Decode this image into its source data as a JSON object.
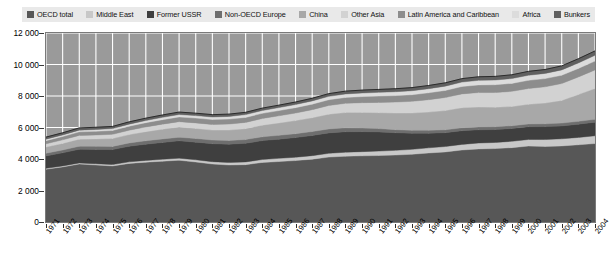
{
  "chart_data": {
    "type": "area",
    "title": "",
    "xlabel": "",
    "ylabel": "",
    "ylim": [
      0,
      12000
    ],
    "yticks": [
      "0",
      "2 000",
      "4 000",
      "6 000",
      "8 000",
      "10 000",
      "12 000"
    ],
    "ytick_values": [
      0,
      2000,
      4000,
      6000,
      8000,
      10000,
      12000
    ],
    "grid": true,
    "legend_position": "top",
    "stacked": true,
    "categories": [
      "1971",
      "1972",
      "1973",
      "1974",
      "1975",
      "1976",
      "1977",
      "1978",
      "1979",
      "1980",
      "1981",
      "1982",
      "1983",
      "1984",
      "1985",
      "1986",
      "1987",
      "1988",
      "1989",
      "1990",
      "1991",
      "1992",
      "1993",
      "1994",
      "1995",
      "1996",
      "1997",
      "1998",
      "1999",
      "2000",
      "2001",
      "2002",
      "2003",
      "2004"
    ],
    "series": [
      {
        "name": "OECD total",
        "color": "#575757",
        "values": [
          3350,
          3500,
          3680,
          3620,
          3560,
          3720,
          3800,
          3860,
          3920,
          3810,
          3680,
          3620,
          3640,
          3780,
          3840,
          3900,
          3990,
          4120,
          4180,
          4200,
          4220,
          4250,
          4300,
          4380,
          4450,
          4570,
          4640,
          4660,
          4720,
          4820,
          4800,
          4830,
          4900,
          4980
        ]
      },
      {
        "name": "Middle East",
        "color": "#c8c8c8",
        "values": [
          55,
          62,
          70,
          78,
          88,
          98,
          110,
          120,
          132,
          140,
          150,
          162,
          176,
          188,
          200,
          212,
          224,
          238,
          252,
          268,
          282,
          298,
          312,
          328,
          342,
          358,
          374,
          390,
          404,
          420,
          436,
          452,
          470,
          492
        ]
      },
      {
        "name": "Former USSR",
        "color": "#3f3f3f",
        "values": [
          790,
          830,
          870,
          910,
          950,
          990,
          1030,
          1070,
          1100,
          1120,
          1140,
          1160,
          1180,
          1200,
          1220,
          1250,
          1280,
          1300,
          1300,
          1270,
          1220,
          1120,
          1020,
          930,
          880,
          870,
          840,
          820,
          810,
          810,
          820,
          820,
          840,
          860
        ]
      },
      {
        "name": "Non-OECD Europe",
        "color": "#6e6e6e",
        "values": [
          170,
          180,
          190,
          196,
          202,
          210,
          218,
          224,
          230,
          232,
          234,
          236,
          238,
          240,
          242,
          246,
          248,
          250,
          246,
          228,
          208,
          196,
          188,
          182,
          182,
          186,
          184,
          180,
          176,
          176,
          178,
          178,
          180,
          184
        ]
      },
      {
        "name": "China",
        "color": "#a8a8a8",
        "values": [
          390,
          420,
          450,
          470,
          500,
          530,
          580,
          620,
          650,
          640,
          630,
          660,
          690,
          740,
          790,
          830,
          880,
          940,
          970,
          990,
          1010,
          1050,
          1100,
          1160,
          1220,
          1270,
          1260,
          1240,
          1220,
          1250,
          1320,
          1440,
          1700,
          1960
        ]
      },
      {
        "name": "Other Asia",
        "color": "#d2d2d2",
        "values": [
          210,
          225,
          240,
          250,
          265,
          280,
          300,
          320,
          340,
          350,
          360,
          380,
          400,
          425,
          450,
          480,
          510,
          550,
          585,
          620,
          655,
          700,
          740,
          785,
          830,
          880,
          920,
          930,
          965,
          1000,
          1030,
          1070,
          1120,
          1180
        ]
      },
      {
        "name": "Latin America and Caribbean",
        "color": "#8d8d8d",
        "values": [
          200,
          210,
          225,
          235,
          245,
          258,
          270,
          285,
          300,
          305,
          310,
          315,
          318,
          325,
          332,
          342,
          352,
          365,
          375,
          385,
          398,
          410,
          422,
          438,
          450,
          468,
          485,
          495,
          505,
          520,
          520,
          528,
          540,
          560
        ]
      },
      {
        "name": "Africa",
        "color": "#dcdcdc",
        "values": [
          95,
          100,
          108,
          114,
          120,
          128,
          136,
          144,
          152,
          158,
          164,
          170,
          176,
          182,
          190,
          198,
          206,
          214,
          222,
          230,
          238,
          246,
          254,
          262,
          272,
          282,
          292,
          300,
          310,
          320,
          330,
          340,
          352,
          366
        ]
      },
      {
        "name": "Bunkers",
        "color": "#606060",
        "values": [
          130,
          136,
          142,
          140,
          138,
          144,
          148,
          152,
          156,
          152,
          148,
          146,
          146,
          150,
          154,
          160,
          166,
          172,
          178,
          184,
          186,
          192,
          196,
          202,
          210,
          218,
          226,
          230,
          238,
          248,
          248,
          254,
          264,
          278
        ]
      }
    ]
  },
  "legend": {
    "items": [
      {
        "label": "OECD total",
        "color": "#575757"
      },
      {
        "label": "Middle East",
        "color": "#c8c8c8"
      },
      {
        "label": "Former USSR",
        "color": "#3f3f3f"
      },
      {
        "label": "Non-OECD Europe",
        "color": "#6e6e6e"
      },
      {
        "label": "China",
        "color": "#a8a8a8"
      },
      {
        "label": "Other Asia",
        "color": "#d2d2d2"
      },
      {
        "label": "Latin America and Caribbean",
        "color": "#8d8d8d"
      },
      {
        "label": "Africa",
        "color": "#dcdcdc"
      },
      {
        "label": "Bunkers",
        "color": "#606060"
      }
    ]
  },
  "style": {
    "plot_background": "#9a9a9a",
    "grid_color": "#ffffff",
    "axis_color": "#7a7a7a",
    "legend_background": "#e9e9e9"
  }
}
